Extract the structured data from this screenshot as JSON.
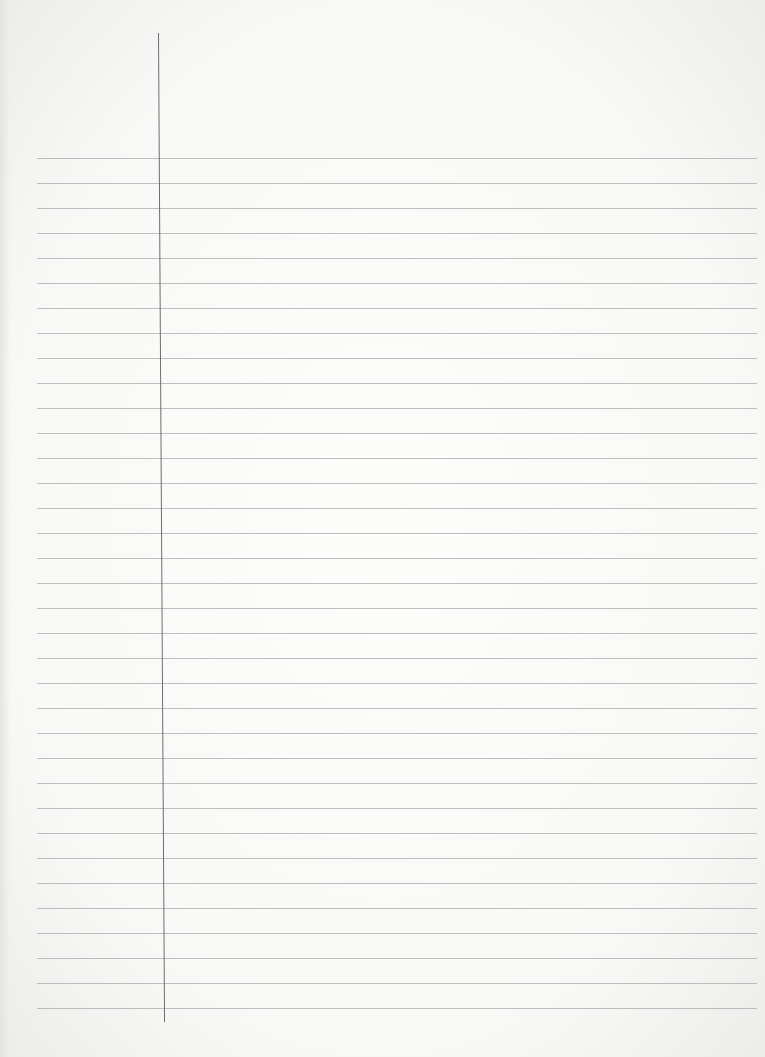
{
  "document": {
    "title": "",
    "type": "lined notebook paper",
    "ruled_line_count": 35,
    "ruled_line_start_y": 158,
    "ruled_line_spacing_px": 25,
    "colors": {
      "paper": "#f8f8f7",
      "rule": "#a9a9a9",
      "margin_line": "#6e6e6e"
    }
  }
}
